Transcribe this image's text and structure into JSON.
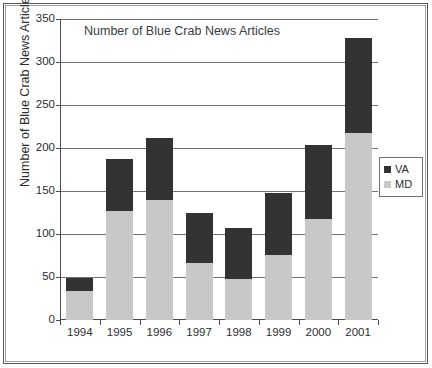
{
  "chart_data": {
    "type": "bar",
    "subtype": "stacked-vertical-bar",
    "title": "Number of Blue Crab News Articles",
    "xlabel": "",
    "ylabel": "Number of Blue Crab News Articles",
    "categories": [
      "1994",
      "1995",
      "1996",
      "1997",
      "1998",
      "1999",
      "2000",
      "2001"
    ],
    "series": [
      {
        "name": "MD",
        "color": "#c8c8c8",
        "values": [
          34,
          127,
          140,
          66,
          48,
          76,
          117,
          217
        ]
      },
      {
        "name": "VA",
        "color": "#333333",
        "values": [
          15,
          60,
          72,
          59,
          59,
          72,
          87,
          111
        ]
      }
    ],
    "stack_totals": [
      49,
      187,
      212,
      125,
      107,
      148,
      204,
      328
    ],
    "ylim": [
      0,
      350
    ],
    "ytick_values": [
      0,
      50,
      100,
      150,
      200,
      250,
      300,
      350
    ],
    "ytick_labels": [
      "0",
      "50",
      "100",
      "150",
      "200",
      "250",
      "300",
      "350"
    ],
    "grid": "horizontal",
    "legend_position": "right",
    "legend_entries": [
      "VA",
      "MD"
    ]
  },
  "legend": {
    "items": [
      {
        "label": "VA",
        "color": "#333333"
      },
      {
        "label": "MD",
        "color": "#c8c8c8"
      }
    ]
  },
  "colors": {
    "va": "#333333",
    "md": "#c8c8c8",
    "axis": "#4a4d4f",
    "grid": "#6e7376",
    "text": "#2b2d2e",
    "frame_outer": "#55585a",
    "frame_inner": "#9aa0a3",
    "background": "#ffffff"
  }
}
